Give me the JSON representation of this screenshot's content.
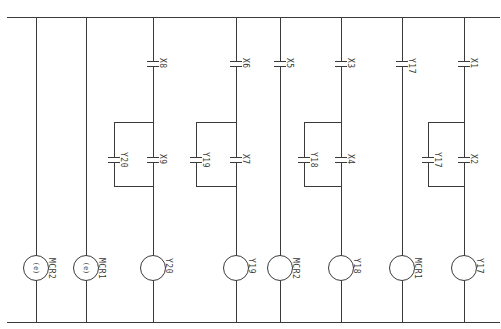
{
  "diagram": {
    "type": "ladder-logic",
    "orientation": "rotated-90",
    "colors": {
      "line": "#3a3a3a",
      "background": "#ffffff"
    },
    "rails": {
      "top": {
        "y": 17,
        "x1": 7,
        "x2": 499
      },
      "bottom": {
        "y": 322,
        "x1": 7,
        "x2": 499
      }
    },
    "rungs": [
      {
        "x": 36,
        "coil": {
          "label": "MCR2",
          "inner": "(e)"
        },
        "series": [],
        "parallel": null
      },
      {
        "x": 86,
        "coil": {
          "label": "MCR1",
          "inner": "(e)"
        },
        "series": [],
        "parallel": null
      },
      {
        "x": 153,
        "coil": {
          "label": "Y20",
          "inner": ""
        },
        "series": [
          {
            "label": "X8",
            "y": 64
          }
        ],
        "parallel": {
          "box_left": 114,
          "top": 122,
          "bottom": 186,
          "main": {
            "label": "X9",
            "y": 160
          },
          "branch": {
            "label": "Y20",
            "y": 160
          }
        }
      },
      {
        "x": 236,
        "coil": {
          "label": "Y19",
          "inner": ""
        },
        "series": [
          {
            "label": "X6",
            "y": 64
          }
        ],
        "parallel": {
          "box_left": 196,
          "top": 122,
          "bottom": 186,
          "main": {
            "label": "X7",
            "y": 160
          },
          "branch": {
            "label": "Y19",
            "y": 160
          }
        }
      },
      {
        "x": 280,
        "coil": {
          "label": "MCR2",
          "inner": ""
        },
        "series": [
          {
            "label": "X5",
            "y": 64
          }
        ],
        "parallel": null
      },
      {
        "x": 341,
        "coil": {
          "label": "Y18",
          "inner": ""
        },
        "series": [
          {
            "label": "X3",
            "y": 64
          }
        ],
        "parallel": {
          "box_left": 304,
          "top": 122,
          "bottom": 186,
          "main": {
            "label": "X4",
            "y": 160
          },
          "branch": {
            "label": "Y18",
            "y": 160
          }
        }
      },
      {
        "x": 402,
        "coil": {
          "label": "MCR1",
          "inner": ""
        },
        "series": [
          {
            "label": "Y17",
            "y": 64
          }
        ],
        "parallel": null
      },
      {
        "x": 464,
        "coil": {
          "label": "Y17",
          "inner": ""
        },
        "series": [
          {
            "label": "X1",
            "y": 64
          }
        ],
        "parallel": {
          "box_left": 428,
          "top": 122,
          "bottom": 186,
          "main": {
            "label": "X2",
            "y": 160
          },
          "branch": {
            "label": "Y17",
            "y": 160
          }
        }
      }
    ],
    "coil_center_y": 268,
    "coil_radius": 13
  }
}
